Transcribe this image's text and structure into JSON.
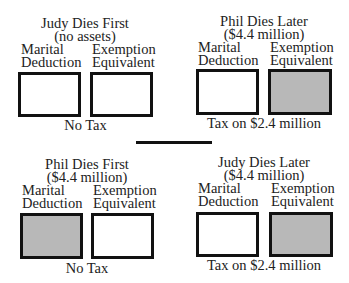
{
  "panels": [
    {
      "title": "Judy Dies First",
      "subtitle": "(no assets)",
      "left_label": [
        "Marital",
        "Deduction"
      ],
      "right_label": [
        "Exemption",
        "Equivalent"
      ],
      "left_shaded": false,
      "right_shaded": false,
      "result": "No Tax"
    },
    {
      "title": "Phil Dies Later",
      "subtitle": "($4.4 million)",
      "left_label": [
        "Marital",
        "Deduction"
      ],
      "right_label": [
        "Exemption",
        "Equivalent"
      ],
      "left_shaded": false,
      "right_shaded": true,
      "result": "Tax on $2.4 million"
    },
    {
      "title": "Phil Dies First",
      "subtitle": "($4.4 million)",
      "left_label": [
        "Marital",
        "Deduction"
      ],
      "right_label": [
        "Exemption",
        "Equivalent"
      ],
      "left_shaded": true,
      "right_shaded": false,
      "result": "No Tax"
    },
    {
      "title": "Judy Dies Later",
      "subtitle": "($4.4 million)",
      "left_label": [
        "Marital",
        "Deduction"
      ],
      "right_label": [
        "Exemption",
        "Equivalent"
      ],
      "left_shaded": false,
      "right_shaded": true,
      "result": "Tax on $2.4 million"
    }
  ],
  "colors": {
    "border": "#111111",
    "shaded": "#b8b8b8",
    "background": "#ffffff"
  }
}
